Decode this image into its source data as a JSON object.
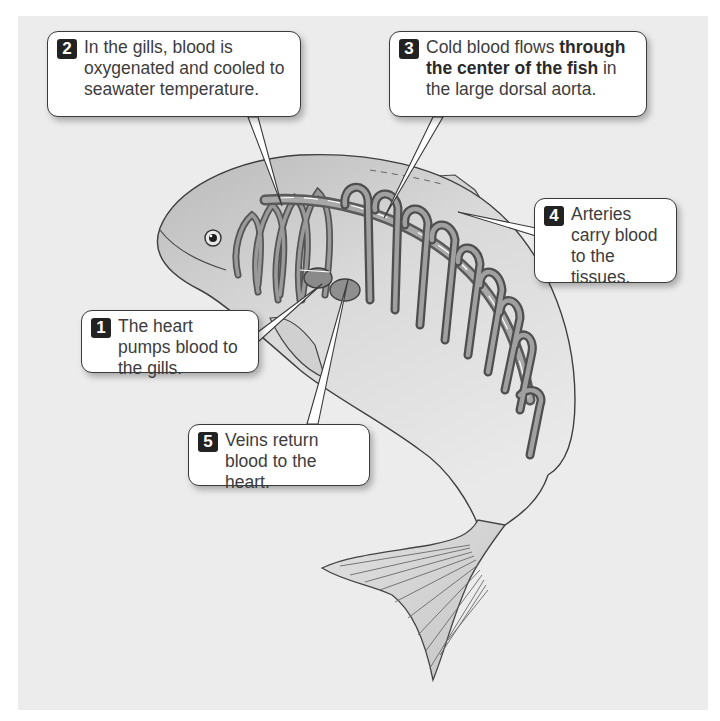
{
  "figure": {
    "background_color": "#ececec",
    "callouts": [
      {
        "id": 1,
        "number": "1",
        "text": "The heart pumps blood to the gills."
      },
      {
        "id": 2,
        "number": "2",
        "text": "In the gills, blood is oxygenated and cooled to seawater temperature."
      },
      {
        "id": 3,
        "number": "3",
        "text_before": "Cold blood flows ",
        "text_bold": "through the center of the fish",
        "text_after": " in the large dorsal aorta."
      },
      {
        "id": 4,
        "number": "4",
        "text": "Arteries carry blood to the tissues."
      },
      {
        "id": 5,
        "number": "5",
        "text": "Veins return blood to the heart."
      }
    ],
    "parts_depicted": [
      "eye",
      "gills",
      "heart",
      "dorsal aorta",
      "arteries",
      "veins",
      "dorsal fin",
      "pectoral fin",
      "caudal fin"
    ]
  }
}
